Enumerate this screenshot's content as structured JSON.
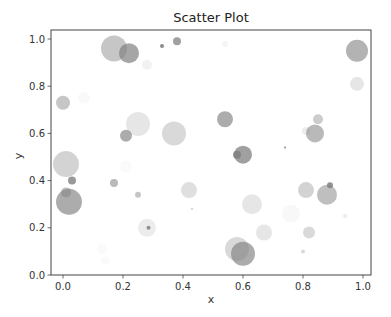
{
  "chart_data": {
    "type": "scatter",
    "title": "Scatter Plot",
    "xlabel": "x",
    "ylabel": "y",
    "xlim": [
      -0.04,
      1.03
    ],
    "ylim": [
      0.0,
      1.04
    ],
    "grid": false,
    "legend": null,
    "x_ticks": [
      "0.0",
      "0.2",
      "0.4",
      "0.6",
      "0.8",
      "1.0"
    ],
    "y_ticks": [
      "0.0",
      "0.2",
      "0.4",
      "0.6",
      "0.8",
      "1.0"
    ],
    "marker_color": "#808080",
    "points": [
      {
        "x": 0.17,
        "y": 0.96,
        "r": 13,
        "alpha": 0.45
      },
      {
        "x": 0.22,
        "y": 0.94,
        "r": 10,
        "alpha": 0.7
      },
      {
        "x": 0.28,
        "y": 0.89,
        "r": 5,
        "alpha": 0.1
      },
      {
        "x": 0.33,
        "y": 0.97,
        "r": 2,
        "alpha": 0.9
      },
      {
        "x": 0.38,
        "y": 0.99,
        "r": 4,
        "alpha": 0.75
      },
      {
        "x": 0.54,
        "y": 0.98,
        "r": 3,
        "alpha": 0.08
      },
      {
        "x": 0.98,
        "y": 0.95,
        "r": 11,
        "alpha": 0.6
      },
      {
        "x": 0.98,
        "y": 0.81,
        "r": 7,
        "alpha": 0.2
      },
      {
        "x": 0.0,
        "y": 0.73,
        "r": 7,
        "alpha": 0.45
      },
      {
        "x": 0.07,
        "y": 0.75,
        "r": 6,
        "alpha": 0.05
      },
      {
        "x": 0.25,
        "y": 0.64,
        "r": 12,
        "alpha": 0.2
      },
      {
        "x": 0.21,
        "y": 0.59,
        "r": 6,
        "alpha": 0.65
      },
      {
        "x": 0.37,
        "y": 0.6,
        "r": 12,
        "alpha": 0.3
      },
      {
        "x": 0.54,
        "y": 0.66,
        "r": 8,
        "alpha": 0.65
      },
      {
        "x": 0.6,
        "y": 0.51,
        "r": 9,
        "alpha": 0.75
      },
      {
        "x": 0.58,
        "y": 0.51,
        "r": 4,
        "alpha": 0.85
      },
      {
        "x": 0.85,
        "y": 0.66,
        "r": 5,
        "alpha": 0.4
      },
      {
        "x": 0.84,
        "y": 0.6,
        "r": 9,
        "alpha": 0.55
      },
      {
        "x": 0.81,
        "y": 0.61,
        "r": 4,
        "alpha": 0.15
      },
      {
        "x": 0.74,
        "y": 0.54,
        "r": 1,
        "alpha": 0.9
      },
      {
        "x": 0.01,
        "y": 0.47,
        "r": 13,
        "alpha": 0.35
      },
      {
        "x": 0.03,
        "y": 0.4,
        "r": 4,
        "alpha": 0.8
      },
      {
        "x": 0.01,
        "y": 0.35,
        "r": 5,
        "alpha": 0.5
      },
      {
        "x": 0.02,
        "y": 0.31,
        "r": 13,
        "alpha": 0.65
      },
      {
        "x": 0.17,
        "y": 0.39,
        "r": 4,
        "alpha": 0.55
      },
      {
        "x": 0.25,
        "y": 0.34,
        "r": 3,
        "alpha": 0.45
      },
      {
        "x": 0.21,
        "y": 0.46,
        "r": 6,
        "alpha": 0.04
      },
      {
        "x": 0.42,
        "y": 0.36,
        "r": 8,
        "alpha": 0.25
      },
      {
        "x": 0.43,
        "y": 0.28,
        "r": 1,
        "alpha": 0.4
      },
      {
        "x": 0.28,
        "y": 0.2,
        "r": 9,
        "alpha": 0.15
      },
      {
        "x": 0.285,
        "y": 0.2,
        "r": 2,
        "alpha": 0.85
      },
      {
        "x": 0.63,
        "y": 0.3,
        "r": 10,
        "alpha": 0.2
      },
      {
        "x": 0.67,
        "y": 0.18,
        "r": 8,
        "alpha": 0.2
      },
      {
        "x": 0.58,
        "y": 0.11,
        "r": 12,
        "alpha": 0.3
      },
      {
        "x": 0.6,
        "y": 0.09,
        "r": 12,
        "alpha": 0.65
      },
      {
        "x": 0.81,
        "y": 0.36,
        "r": 8,
        "alpha": 0.35
      },
      {
        "x": 0.88,
        "y": 0.34,
        "r": 10,
        "alpha": 0.5
      },
      {
        "x": 0.89,
        "y": 0.38,
        "r": 3,
        "alpha": 0.85
      },
      {
        "x": 0.76,
        "y": 0.26,
        "r": 9,
        "alpha": 0.06
      },
      {
        "x": 0.82,
        "y": 0.18,
        "r": 6,
        "alpha": 0.3
      },
      {
        "x": 0.8,
        "y": 0.1,
        "r": 2,
        "alpha": 0.3
      },
      {
        "x": 0.94,
        "y": 0.25,
        "r": 2,
        "alpha": 0.15
      },
      {
        "x": 0.13,
        "y": 0.11,
        "r": 5,
        "alpha": 0.04
      },
      {
        "x": 0.14,
        "y": 0.06,
        "r": 4,
        "alpha": 0.04
      }
    ]
  }
}
